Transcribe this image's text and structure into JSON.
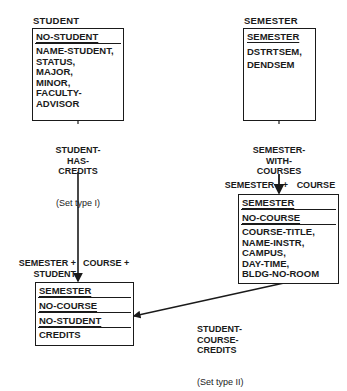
{
  "records": {
    "student": {
      "name": "STUDENT",
      "key": "NO-STUDENT",
      "attributes": "NAME-STUDENT,\nSTATUS,\nMAJOR,\nMINOR,\nFACULTY-\nADVISOR"
    },
    "semester": {
      "name": "SEMESTER",
      "key": "SEMESTER",
      "attributes": "DSTRTSEM,\nDENDSEM"
    },
    "course": {
      "key_label": "SEMESTER + COURSE",
      "keys": [
        "SEMESTER",
        "NO-COURSE"
      ],
      "attributes": "COURSE-TITLE,\nNAME-INSTR,\nCAMPUS,\nDAY-TIME,\nBLDG-NO-ROOM"
    },
    "credits": {
      "key_label_left": "SEMESTER +\nSTUDENT",
      "key_label_right": "COURSE +",
      "keys": [
        "SEMESTER",
        "NO-COURSE",
        "NO-STUDENT"
      ],
      "attributes": "CREDITS"
    }
  },
  "sets": {
    "student_has_credits": {
      "name": "STUDENT-\nHAS-\nCREDITS",
      "type": "(Set type I)"
    },
    "semester_with_courses": {
      "name": "SEMESTER-\nWITH-\nCOURSES",
      "type": "(Set type III)"
    },
    "student_course_credits": {
      "name": "STUDENT-\nCOURSE-\nCREDITS",
      "type": "(Set type II)"
    }
  },
  "colors": {
    "line": "#1a1a1a",
    "background": "#ffffff"
  }
}
